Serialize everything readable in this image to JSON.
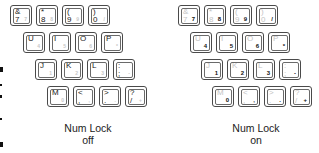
{
  "groups": [
    {
      "state": "off",
      "caption_line1": "Num Lock",
      "caption_line2": "off",
      "rows": [
        [
          {
            "top": "&",
            "bottom": "7",
            "num": "7"
          },
          {
            "top": "*",
            "bottom": "8",
            "num": "8"
          },
          {
            "top": "(",
            "bottom": "9",
            "num": "9"
          },
          {
            "top": ")",
            "bottom": "0",
            "num": "/"
          }
        ],
        [
          {
            "top": "U",
            "bottom": "",
            "num": "4"
          },
          {
            "top": "I",
            "bottom": "",
            "num": "5"
          },
          {
            "top": "O",
            "bottom": "",
            "num": "6"
          },
          {
            "top": "P",
            "bottom": "",
            "num": "*"
          }
        ],
        [
          {
            "top": "J",
            "bottom": "",
            "num": "1"
          },
          {
            "top": "K",
            "bottom": "",
            "num": "2"
          },
          {
            "top": "L",
            "bottom": "",
            "num": "3"
          },
          {
            "top": ":",
            "bottom": ";",
            "num": "-"
          }
        ],
        [
          {
            "top": "M",
            "bottom": "",
            "num": "0"
          },
          {
            "top": "<",
            "bottom": ",",
            "num": ","
          },
          {
            "top": ">",
            "bottom": ".",
            "num": "."
          },
          {
            "top": "?",
            "bottom": "/",
            "num": "+"
          }
        ]
      ]
    },
    {
      "state": "on",
      "caption_line1": "Num Lock",
      "caption_line2": "on",
      "rows": [
        [
          {
            "top": "&",
            "bottom": "7",
            "num": "7"
          },
          {
            "top": "*",
            "bottom": "8",
            "num": "8"
          },
          {
            "top": "(",
            "bottom": "9",
            "num": "9"
          },
          {
            "top": ")",
            "bottom": "0",
            "num": "/"
          }
        ],
        [
          {
            "top": "U",
            "bottom": "",
            "num": "4"
          },
          {
            "top": "I",
            "bottom": "",
            "num": "5"
          },
          {
            "top": "O",
            "bottom": "",
            "num": "6"
          },
          {
            "top": "P",
            "bottom": "",
            "num": "*"
          }
        ],
        [
          {
            "top": "J",
            "bottom": "",
            "num": "1"
          },
          {
            "top": "K",
            "bottom": "",
            "num": "2"
          },
          {
            "top": "L",
            "bottom": "",
            "num": "3"
          },
          {
            "top": ":",
            "bottom": ";",
            "num": "-"
          }
        ],
        [
          {
            "top": "M",
            "bottom": "",
            "num": "0"
          },
          {
            "top": "<",
            "bottom": ",",
            "num": ","
          },
          {
            "top": ">",
            "bottom": ".",
            "num": "."
          },
          {
            "top": "?",
            "bottom": "/",
            "num": "+"
          }
        ]
      ]
    }
  ]
}
